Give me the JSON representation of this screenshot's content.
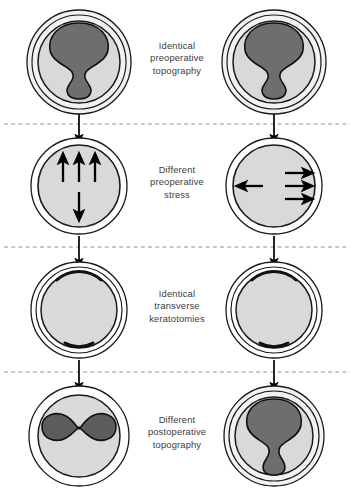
{
  "figure": {
    "columns": [
      "left-eye",
      "right-eye"
    ],
    "background_color": "#ffffff",
    "colors": {
      "outline": "#1a1a1a",
      "cornea_fill": "#d9d9d9",
      "sclera_fill": "#f2f2f2",
      "topography_fill": "#6e6e6e",
      "topography_fill_dark": "#5d5d5d",
      "arrow": "#000000",
      "divider": "#a08f7a",
      "text": "#3b3b3b"
    },
    "rows": [
      {
        "id": "row-preoperative-topography",
        "label_lines": [
          "Identical",
          "preoperative",
          "topography"
        ],
        "left_shape": "hourglass-vertical",
        "right_shape": "hourglass-vertical"
      },
      {
        "id": "row-preoperative-stress",
        "label_lines": [
          "Different",
          "preoperative",
          "stress"
        ],
        "left_shape": "stress-arrows-vertical",
        "right_shape": "stress-arrows-horizontal",
        "left_arrows": {
          "up": 3,
          "down": 1
        },
        "right_arrows": {
          "right": 3,
          "left": 1
        }
      },
      {
        "id": "row-transverse-keratotomies",
        "label_lines": [
          "Identical",
          "transverse",
          "keratotomies"
        ],
        "left_shape": "keratotomy-arcs",
        "right_shape": "keratotomy-arcs",
        "incisions": {
          "top": 1,
          "bottom": 1
        }
      },
      {
        "id": "row-postoperative-topography",
        "label_lines": [
          "Different",
          "postoperative",
          "topography"
        ],
        "left_shape": "bowtie-horizontal",
        "right_shape": "hourglass-vertical-pronounced"
      }
    ],
    "dividers": 3,
    "flow_arrows": 6
  }
}
